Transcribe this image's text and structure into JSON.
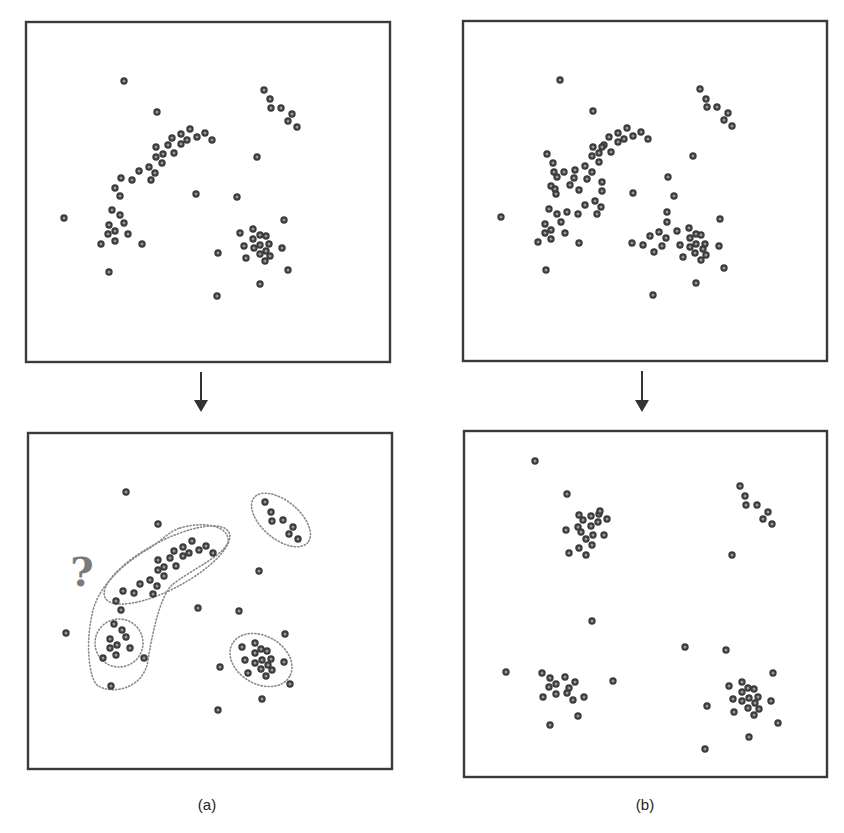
{
  "figure": {
    "type": "clustering-illustration",
    "colors": {
      "frame": "#3a3a3a",
      "dot_stroke": "#3c3c3c",
      "dot_fill": "#9a9a9a",
      "outline": "#8a8a8a",
      "question_mark": "#7a7a7a",
      "arrow": "#333333"
    },
    "captions": [
      {
        "id": "a",
        "label": "(a)",
        "x": 207,
        "y": 796
      },
      {
        "id": "b",
        "label": "(b)",
        "x": 645,
        "y": 796
      }
    ],
    "arrows": [
      {
        "id": "arrow-a",
        "x": 201,
        "y1": 372,
        "y2": 412
      },
      {
        "id": "arrow-b",
        "x": 642,
        "y1": 371,
        "y2": 412
      }
    ],
    "annotation": {
      "text": "?",
      "x": 82,
      "y": 586
    },
    "panels": [
      {
        "id": "a-top",
        "name": "panel-a-before",
        "frame": {
          "x": 26,
          "y": 22,
          "w": 364,
          "h": 340
        },
        "dots": [
          [
            124,
            81
          ],
          [
            157,
            112
          ],
          [
            264,
            90
          ],
          [
            270,
            99
          ],
          [
            271,
            108
          ],
          [
            281,
            108
          ],
          [
            292,
            114
          ],
          [
            288,
            121
          ],
          [
            297,
            127
          ],
          [
            190,
            129
          ],
          [
            181,
            134
          ],
          [
            172,
            138
          ],
          [
            187,
            140
          ],
          [
            197,
            137
          ],
          [
            205,
            133
          ],
          [
            212,
            140
          ],
          [
            181,
            144
          ],
          [
            168,
            145
          ],
          [
            156,
            147
          ],
          [
            163,
            154
          ],
          [
            174,
            153
          ],
          [
            156,
            157
          ],
          [
            162,
            163
          ],
          [
            149,
            167
          ],
          [
            155,
            173
          ],
          [
            139,
            171
          ],
          [
            151,
            180
          ],
          [
            132,
            180
          ],
          [
            121,
            178
          ],
          [
            115,
            188
          ],
          [
            120,
            196
          ],
          [
            257,
            157
          ],
          [
            196,
            194
          ],
          [
            237,
            197
          ],
          [
            64,
            218
          ],
          [
            112,
            210
          ],
          [
            120,
            215
          ],
          [
            124,
            223
          ],
          [
            109,
            225
          ],
          [
            115,
            231
          ],
          [
            108,
            234
          ],
          [
            128,
            234
          ],
          [
            115,
            241
          ],
          [
            101,
            244
          ],
          [
            142,
            244
          ],
          [
            109,
            272
          ],
          [
            284,
            220
          ],
          [
            240,
            233
          ],
          [
            253,
            229
          ],
          [
            253,
            239
          ],
          [
            260,
            235
          ],
          [
            266,
            236
          ],
          [
            269,
            244
          ],
          [
            260,
            245
          ],
          [
            254,
            248
          ],
          [
            244,
            246
          ],
          [
            266,
            251
          ],
          [
            260,
            254
          ],
          [
            270,
            256
          ],
          [
            265,
            261
          ],
          [
            246,
            258
          ],
          [
            282,
            248
          ],
          [
            288,
            270
          ],
          [
            218,
            253
          ],
          [
            260,
            284
          ],
          [
            217,
            296
          ]
        ]
      },
      {
        "id": "b-top",
        "name": "panel-b-before",
        "frame": {
          "x": 463,
          "y": 21,
          "w": 364,
          "h": 340
        },
        "dots": [
          [
            560,
            80
          ],
          [
            593,
            111
          ],
          [
            700,
            89
          ],
          [
            706,
            99
          ],
          [
            707,
            107
          ],
          [
            717,
            107
          ],
          [
            728,
            113
          ],
          [
            724,
            120
          ],
          [
            732,
            126
          ],
          [
            627,
            128
          ],
          [
            618,
            133
          ],
          [
            609,
            137
          ],
          [
            641,
            132
          ],
          [
            633,
            136
          ],
          [
            624,
            139
          ],
          [
            648,
            139
          ],
          [
            618,
            142
          ],
          [
            604,
            145
          ],
          [
            593,
            147
          ],
          [
            602,
            147
          ],
          [
            611,
            152
          ],
          [
            599,
            153
          ],
          [
            592,
            156
          ],
          [
            599,
            162
          ],
          [
            585,
            166
          ],
          [
            575,
            170
          ],
          [
            592,
            172
          ],
          [
            587,
            179
          ],
          [
            574,
            178
          ],
          [
            602,
            182
          ],
          [
            570,
            185
          ],
          [
            579,
            190
          ],
          [
            602,
            191
          ],
          [
            564,
            172
          ],
          [
            547,
            154
          ],
          [
            553,
            163
          ],
          [
            554,
            172
          ],
          [
            557,
            177
          ],
          [
            551,
            186
          ],
          [
            555,
            189
          ],
          [
            556,
            194
          ],
          [
            693,
            156
          ],
          [
            668,
            177
          ],
          [
            633,
            193
          ],
          [
            674,
            196
          ],
          [
            501,
            217
          ],
          [
            549,
            209
          ],
          [
            557,
            214
          ],
          [
            567,
            212
          ],
          [
            578,
            214
          ],
          [
            585,
            205
          ],
          [
            595,
            201
          ],
          [
            601,
            207
          ],
          [
            597,
            214
          ],
          [
            561,
            222
          ],
          [
            545,
            224
          ],
          [
            551,
            230
          ],
          [
            545,
            233
          ],
          [
            565,
            233
          ],
          [
            551,
            239
          ],
          [
            538,
            242
          ],
          [
            579,
            243
          ],
          [
            546,
            270
          ],
          [
            667,
            212
          ],
          [
            667,
            222
          ],
          [
            720,
            219
          ],
          [
            659,
            232
          ],
          [
            650,
            236
          ],
          [
            677,
            231
          ],
          [
            666,
            238
          ],
          [
            632,
            243
          ],
          [
            643,
            245
          ],
          [
            662,
            246
          ],
          [
            654,
            252
          ],
          [
            689,
            228
          ],
          [
            696,
            234
          ],
          [
            701,
            235
          ],
          [
            690,
            238
          ],
          [
            680,
            245
          ],
          [
            696,
            244
          ],
          [
            705,
            244
          ],
          [
            690,
            247
          ],
          [
            703,
            249
          ],
          [
            695,
            253
          ],
          [
            706,
            255
          ],
          [
            683,
            257
          ],
          [
            701,
            260
          ],
          [
            719,
            246
          ],
          [
            724,
            268
          ],
          [
            696,
            283
          ],
          [
            653,
            295
          ]
        ]
      },
      {
        "id": "a-bottom",
        "name": "panel-a-after",
        "frame": {
          "x": 28,
          "y": 433,
          "w": 364,
          "h": 336
        },
        "dots": [
          [
            126,
            492
          ],
          [
            158,
            524
          ],
          [
            265,
            502
          ],
          [
            271,
            512
          ],
          [
            272,
            521
          ],
          [
            283,
            520
          ],
          [
            293,
            527
          ],
          [
            289,
            534
          ],
          [
            298,
            539
          ],
          [
            192,
            541
          ],
          [
            183,
            547
          ],
          [
            174,
            551
          ],
          [
            189,
            553
          ],
          [
            199,
            550
          ],
          [
            206,
            546
          ],
          [
            213,
            553
          ],
          [
            183,
            556
          ],
          [
            170,
            558
          ],
          [
            158,
            560
          ],
          [
            164,
            567
          ],
          [
            176,
            566
          ],
          [
            158,
            570
          ],
          [
            164,
            576
          ],
          [
            150,
            580
          ],
          [
            157,
            586
          ],
          [
            140,
            584
          ],
          [
            153,
            594
          ],
          [
            134,
            593
          ],
          [
            123,
            591
          ],
          [
            116,
            601
          ],
          [
            121,
            610
          ],
          [
            259,
            571
          ],
          [
            198,
            608
          ],
          [
            239,
            611
          ],
          [
            66,
            633
          ],
          [
            114,
            624
          ],
          [
            122,
            630
          ],
          [
            126,
            637
          ],
          [
            110,
            639
          ],
          [
            117,
            645
          ],
          [
            110,
            648
          ],
          [
            130,
            648
          ],
          [
            116,
            655
          ],
          [
            103,
            658
          ],
          [
            144,
            658
          ],
          [
            111,
            686
          ],
          [
            285,
            634
          ],
          [
            242,
            647
          ],
          [
            255,
            643
          ],
          [
            255,
            653
          ],
          [
            261,
            649
          ],
          [
            267,
            651
          ],
          [
            271,
            659
          ],
          [
            262,
            660
          ],
          [
            255,
            663
          ],
          [
            245,
            660
          ],
          [
            268,
            665
          ],
          [
            261,
            669
          ],
          [
            272,
            670
          ],
          [
            266,
            676
          ],
          [
            248,
            673
          ],
          [
            284,
            662
          ],
          [
            290,
            684
          ],
          [
            220,
            667
          ],
          [
            262,
            699
          ],
          [
            218,
            710
          ]
        ],
        "outlines": [
          {
            "name": "outline-top-right-cluster",
            "kind": "ellipse",
            "cx": 281,
            "cy": 520,
            "rx": 35,
            "ry": 19,
            "rotate": 40
          },
          {
            "name": "outline-arc-cluster",
            "kind": "ellipse",
            "cx": 167,
            "cy": 565,
            "rx": 70,
            "ry": 24,
            "rotate": -28
          },
          {
            "name": "outline-bottom-right-cluster",
            "kind": "ellipse",
            "cx": 261,
            "cy": 660,
            "rx": 33,
            "ry": 24,
            "rotate": 30
          },
          {
            "name": "outline-small-left-cluster",
            "kind": "ellipse",
            "cx": 119,
            "cy": 643,
            "rx": 24,
            "ry": 24,
            "rotate": 0
          },
          {
            "name": "outline-merged-ambiguous-cluster",
            "kind": "path",
            "d": "M 180 528 C 200 522, 225 524, 228 538 C 232 552, 190 570, 172 585 C 160 596, 152 635, 148 660 C 144 690, 110 695, 97 685 C 88 676, 86 640, 92 615 C 96 590, 120 565, 150 548 C 162 540, 170 531, 180 528 Z"
          }
        ]
      },
      {
        "id": "b-bottom",
        "name": "panel-b-after",
        "frame": {
          "x": 464,
          "y": 431,
          "w": 363,
          "h": 346
        },
        "dots": [
          [
            535,
            461
          ],
          [
            567,
            494
          ],
          [
            579,
            515
          ],
          [
            583,
            520
          ],
          [
            591,
            516
          ],
          [
            599,
            514
          ],
          [
            600,
            511
          ],
          [
            607,
            519
          ],
          [
            598,
            522
          ],
          [
            591,
            526
          ],
          [
            578,
            527
          ],
          [
            581,
            532
          ],
          [
            566,
            530
          ],
          [
            593,
            535
          ],
          [
            604,
            535
          ],
          [
            586,
            539
          ],
          [
            592,
            545
          ],
          [
            579,
            548
          ],
          [
            569,
            553
          ],
          [
            586,
            555
          ],
          [
            740,
            486
          ],
          [
            745,
            496
          ],
          [
            746,
            505
          ],
          [
            757,
            505
          ],
          [
            768,
            512
          ],
          [
            763,
            519
          ],
          [
            772,
            524
          ],
          [
            732,
            555
          ],
          [
            592,
            621
          ],
          [
            685,
            647
          ],
          [
            726,
            650
          ],
          [
            506,
            672
          ],
          [
            542,
            673
          ],
          [
            550,
            678
          ],
          [
            565,
            677
          ],
          [
            575,
            682
          ],
          [
            556,
            684
          ],
          [
            549,
            687
          ],
          [
            569,
            688
          ],
          [
            567,
            693
          ],
          [
            556,
            694
          ],
          [
            543,
            697
          ],
          [
            573,
            700
          ],
          [
            584,
            697
          ],
          [
            578,
            716
          ],
          [
            550,
            725
          ],
          [
            613,
            681
          ],
          [
            773,
            673
          ],
          [
            729,
            686
          ],
          [
            742,
            682
          ],
          [
            748,
            688
          ],
          [
            754,
            689
          ],
          [
            742,
            692
          ],
          [
            758,
            697
          ],
          [
            749,
            698
          ],
          [
            742,
            701
          ],
          [
            733,
            699
          ],
          [
            755,
            703
          ],
          [
            759,
            709
          ],
          [
            748,
            708
          ],
          [
            734,
            712
          ],
          [
            754,
            715
          ],
          [
            771,
            701
          ],
          [
            707,
            706
          ],
          [
            778,
            723
          ],
          [
            749,
            737
          ],
          [
            705,
            749
          ]
        ]
      }
    ]
  }
}
